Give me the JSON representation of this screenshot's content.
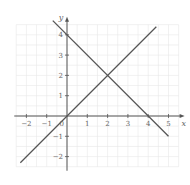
{
  "chart_data": {
    "type": "line",
    "title": "",
    "xlabel": "x",
    "ylabel": "y",
    "xlim": [
      -2.5,
      5.5
    ],
    "ylim": [
      -2.5,
      4.5
    ],
    "grid": true,
    "x_ticks": [
      -2,
      -1,
      1,
      2,
      3,
      4,
      5
    ],
    "y_ticks": [
      -2,
      -1,
      1,
      2,
      3,
      4
    ],
    "origin_label": "0",
    "series": [
      {
        "name": "y = x",
        "equation": "y = x",
        "points": [
          [
            -2.3,
            -2.3
          ],
          [
            4.4,
            4.4
          ]
        ]
      },
      {
        "name": "y = -x + 4",
        "equation": "y = -x + 4",
        "points": [
          [
            -0.7,
            4.7
          ],
          [
            5.0,
            -1.0
          ]
        ]
      }
    ],
    "intersection": [
      2,
      2
    ]
  },
  "colors": {
    "line": "#555555",
    "axis": "#555555",
    "grid": "#e8e8e8",
    "tick_label": "#666666"
  }
}
